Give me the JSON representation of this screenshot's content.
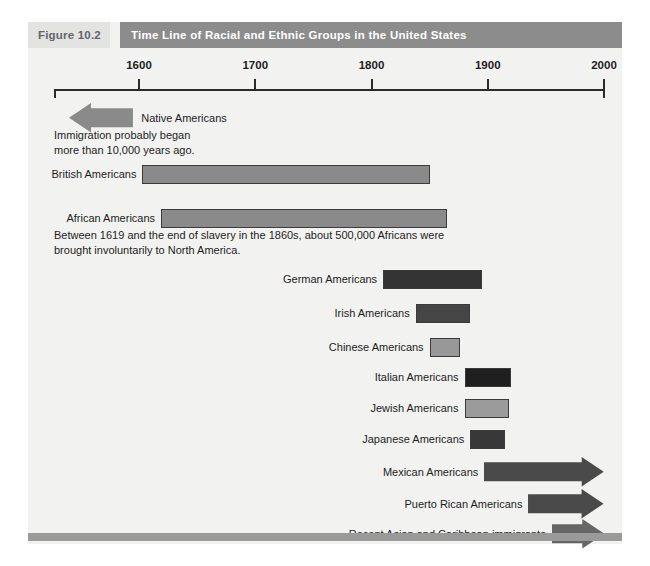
{
  "figure": {
    "number_label": "Figure 10.2",
    "title": "Time Line of Racial and Ethnic Groups in the United States",
    "header_band_color": "#8c8c8c",
    "number_chip_color": "#e3e3e1",
    "panel_background": "#f2f2f0",
    "footer_bar_color": "#9a9a9a"
  },
  "axis": {
    "ticks": [
      {
        "label": "1600",
        "value": 1600
      },
      {
        "label": "1700",
        "value": 1700
      },
      {
        "label": "1800",
        "value": 1800
      },
      {
        "label": "1900",
        "value": 1900
      },
      {
        "label": "2000",
        "value": 2000
      }
    ],
    "range_start": 1600,
    "range_end": 2000
  },
  "chart_data": {
    "type": "bar",
    "title": "Time Line of Racial and Ethnic Groups in the United States",
    "xlabel": "",
    "ylabel": "",
    "xlim": [
      1600,
      2000
    ],
    "grid": false,
    "orientation": "horizontal-timeline",
    "categories": [
      "Native Americans",
      "British Americans",
      "African Americans",
      "German Americans",
      "Irish Americans",
      "Chinese Americans",
      "Italian Americans",
      "Jewish Americans",
      "Japanese Americans",
      "Mexican Americans",
      "Puerto Rican Americans",
      "Recent Asian and Caribbean immigrants"
    ],
    "annotations": [
      "Immigration probably began\nmore than 10,000 years ago.",
      "Between 1619 and the end of slavery in the 1860s, about 500,000 Africans were\nbrought involuntarily to North America."
    ]
  },
  "rows": [
    {
      "label": "Native Americans",
      "shape": "arrow-left",
      "color": "#8a8a8a",
      "label_side": "right",
      "start": 1540,
      "end": 1595,
      "note": "Immigration probably began\nmore than 10,000 years ago."
    },
    {
      "label": "British Americans",
      "shape": "bar",
      "color": "#8a8a8a",
      "label_side": "left",
      "start": 1603,
      "end": 1850,
      "note": ""
    },
    {
      "label": "African Americans",
      "shape": "bar",
      "color": "#8a8a8a",
      "label_side": "left",
      "start": 1619,
      "end": 1865,
      "note": "Between 1619 and the end of slavery in the 1860s, about 500,000 Africans were\nbrought involuntarily to North America."
    },
    {
      "label": "German Americans",
      "shape": "bar",
      "color": "#333333",
      "label_side": "left",
      "start": 1810,
      "end": 1895,
      "note": ""
    },
    {
      "label": "Irish Americans",
      "shape": "bar",
      "color": "#454545",
      "label_side": "left",
      "start": 1838,
      "end": 1885,
      "note": ""
    },
    {
      "label": "Chinese Americans",
      "shape": "bar",
      "color": "#989898",
      "label_side": "left",
      "start": 1850,
      "end": 1876,
      "note": ""
    },
    {
      "label": "Italian Americans",
      "shape": "bar",
      "color": "#1f1f1f",
      "label_side": "left",
      "start": 1880,
      "end": 1920,
      "note": ""
    },
    {
      "label": "Jewish Americans",
      "shape": "bar",
      "color": "#9b9b9b",
      "label_side": "left",
      "start": 1880,
      "end": 1918,
      "note": ""
    },
    {
      "label": "Japanese Americans",
      "shape": "bar",
      "color": "#383838",
      "label_side": "left",
      "start": 1885,
      "end": 1915,
      "note": ""
    },
    {
      "label": "Mexican Americans",
      "shape": "arrow-right",
      "color": "#4a4a4a",
      "label_side": "left",
      "start": 1897,
      "end": 2000,
      "note": ""
    },
    {
      "label": "Puerto Rican Americans",
      "shape": "arrow-right",
      "color": "#4a4a4a",
      "label_side": "left",
      "start": 1935,
      "end": 2000,
      "note": ""
    },
    {
      "label": "Recent Asian and Caribbean immigrants",
      "shape": "arrow-right",
      "color": "#666666",
      "label_side": "left",
      "start": 1955,
      "end": 2000,
      "note": ""
    }
  ]
}
